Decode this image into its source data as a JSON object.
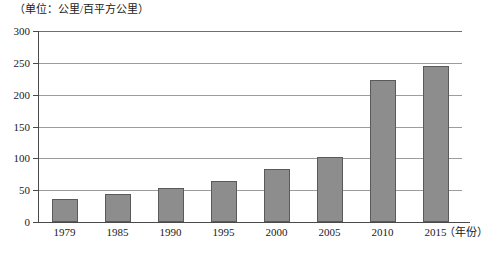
{
  "chart_data": {
    "type": "bar",
    "title": "",
    "subtitle": "",
    "unit_caption": "（单位：公里/百平方公里）",
    "xlabel": "（年份）",
    "ylabel": "",
    "categories": [
      "1979",
      "1985",
      "1990",
      "1995",
      "2000",
      "2005",
      "2010",
      "2015"
    ],
    "values": [
      36,
      44,
      54,
      65,
      83,
      102,
      223,
      245
    ],
    "ylim": [
      0,
      300
    ],
    "yticks": [
      0,
      50,
      100,
      150,
      200,
      250,
      300
    ],
    "ytick_labels": [
      "0",
      "50",
      "100",
      "150",
      "200",
      "250",
      "300"
    ],
    "grid": true,
    "grid_axis": "y",
    "legend": false,
    "legend_position": "none",
    "series": [
      {
        "name": "公路密度",
        "values": [
          36,
          44,
          54,
          65,
          83,
          102,
          223,
          245
        ]
      }
    ],
    "colors": {
      "bar_fill": "#8d8d8d",
      "bar_border": "#5a5a5a",
      "gridline": "#9c9c9c",
      "axis": "#4a4a4a",
      "text": "#1a1a1a",
      "background": "#ffffff"
    }
  }
}
